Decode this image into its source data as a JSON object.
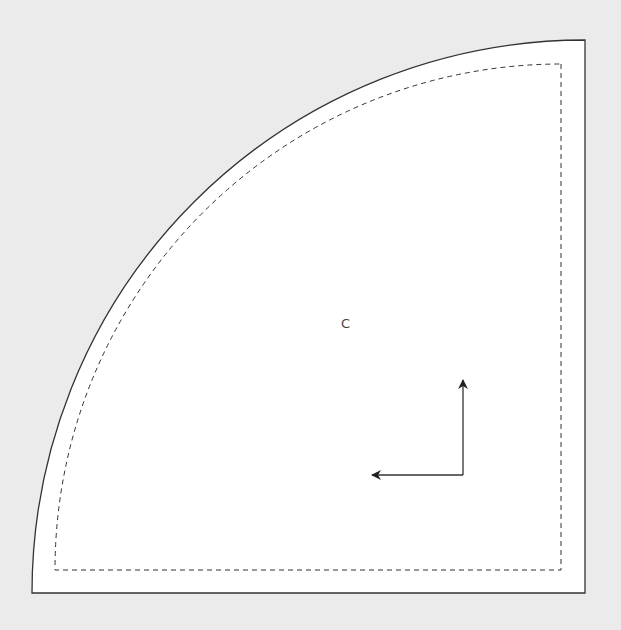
{
  "diagram": {
    "type": "sewing-pattern-piece",
    "shape": "quarter-circle",
    "piece_label": "C",
    "colors": {
      "background": "#ebebeb",
      "piece_fill": "#ffffff",
      "cut_line": "#333333",
      "seam_line": "#333333",
      "arrow": "#333333",
      "label": "#444444"
    },
    "cut_line": {
      "style": "solid",
      "corner": [
        585,
        593
      ],
      "radius": 553
    },
    "seam_line": {
      "style": "dashed",
      "corner": [
        561,
        570
      ],
      "radius": 506
    },
    "arrows": [
      {
        "direction": "up",
        "from": [
          463,
          475
        ],
        "to": [
          463,
          378
        ]
      },
      {
        "direction": "left",
        "from": [
          463,
          475
        ],
        "to": [
          370,
          475
        ]
      }
    ]
  }
}
